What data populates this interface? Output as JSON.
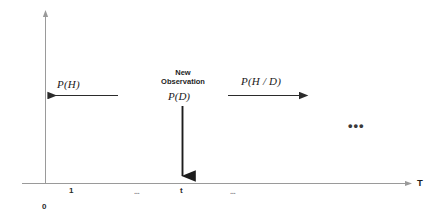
{
  "figure": {
    "background_color": "#ffffff",
    "line_color": "#3a3a3a",
    "axis_color": "#8f8f8f",
    "prior_label": "P(H)",
    "posterior_label": "P(H / D)",
    "observation_caption_line1": "New",
    "observation_caption_line2": "Observation",
    "observation_label": "P(D)",
    "big_ellipsis": "•••"
  },
  "axis": {
    "name": "T",
    "origin_label": "0",
    "ticks": [
      {
        "label": "1"
      },
      {
        "label": "..."
      },
      {
        "label": "t"
      },
      {
        "label": "..."
      }
    ]
  }
}
